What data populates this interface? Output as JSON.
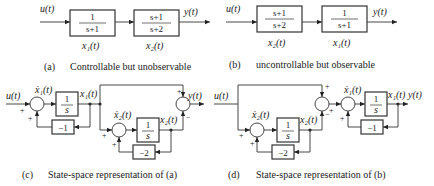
{
  "diagrams": {
    "a": {
      "input_label": "u(t)",
      "output_label": "y(t)",
      "block1": {
        "num": "1",
        "den": "s+1",
        "state": "x₁(t)"
      },
      "block2": {
        "num": "s+1",
        "den": "s+2",
        "state": "x₂(t)"
      },
      "caption_tag": "(a)",
      "caption_text": "Controllable but unobservable"
    },
    "b": {
      "input_label": "u(t)",
      "output_label": "y(t)",
      "block1": {
        "num": "s+1",
        "den": "s+2",
        "state": "x₂(t)"
      },
      "block2": {
        "num": "1",
        "den": "s+1",
        "state": "x₁(t)"
      },
      "caption_tag": "(b)",
      "caption_text": "uncontrollable but observable"
    },
    "c": {
      "input_label": "u(t)",
      "output_label": "y(t)",
      "x1dot": "ẋ₁(t)",
      "x1": "x₁(t)",
      "x2dot": "ẋ₂(t)",
      "x2": "x₂(t)",
      "integrator_num": "1",
      "integrator_den": "s",
      "gain1": "−1",
      "gain2": "−2",
      "plus": "+",
      "minus": "−",
      "caption_tag": "(c)",
      "caption_text": "State-space representation of (a)"
    },
    "d": {
      "input_label": "u(t)",
      "output_label": "y(t)",
      "x1dot": "ẋ₁(t)",
      "x1": "x₁(t)",
      "x2dot": "ẋ₂(t)",
      "x2": "x₂(t)",
      "integrator_num": "1",
      "integrator_den": "s",
      "gain1": "−1",
      "gain2": "−2",
      "plus": "+",
      "minus": "−",
      "caption_tag": "(d)",
      "caption_text": "State-space representation of (b)"
    }
  }
}
